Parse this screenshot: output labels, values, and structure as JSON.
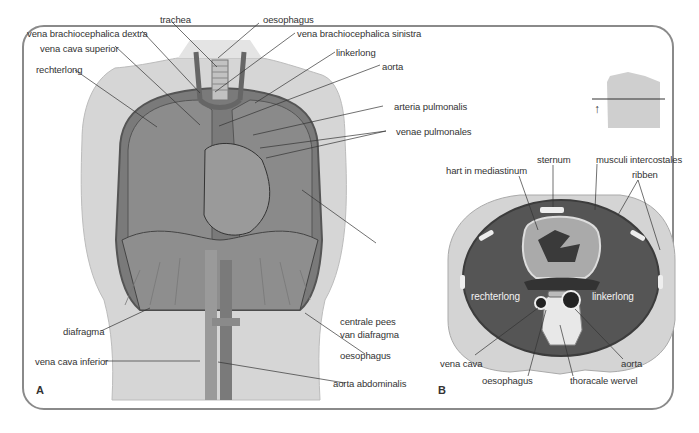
{
  "figure": {
    "panel_a": {
      "letter": "A",
      "labels": {
        "trachea": "trachea",
        "oesophagus_top": "oesophagus",
        "vena_brachiocephalica_dextra": "vena brachiocephalica dextra",
        "vena_brachiocephalica_sinistra": "vena brachiocephalica sinistra",
        "vena_cava_superior": "vena cava superior",
        "linkerlong": "linkerlong",
        "rechterlong": "rechterlong",
        "aorta": "aorta",
        "arteria_pulmonalis": "arteria pulmonalis",
        "venae_pulmonales": "venae pulmonales",
        "centrale_pees_1": "centrale pees",
        "centrale_pees_2": "van diafragma",
        "diafragma": "diafragma",
        "oesophagus_bottom": "oesophagus",
        "vena_cava_inferior": "vena cava inferior",
        "aorta_abdominalis": "aorta abdominalis"
      }
    },
    "panel_b": {
      "letter": "B",
      "labels": {
        "sternum": "sternum",
        "musculi_intercostales": "musculi intercostales",
        "hart_in_mediastinum": "hart in mediastinum",
        "ribben": "ribben",
        "rechterlong": "rechterlong",
        "linkerlong": "linkerlong",
        "vena_cava": "vena cava",
        "oesophagus": "oesophagus",
        "thoracale_wervel": "thoracale wervel",
        "aorta": "aorta"
      },
      "inset_arrow": "↑"
    },
    "colors": {
      "frame": "#8a8a8a",
      "skin": "#d9d9d9",
      "lung": "#6e6e6e",
      "dark_lung": "#4a4a4a",
      "leader_line": "#333333"
    }
  }
}
